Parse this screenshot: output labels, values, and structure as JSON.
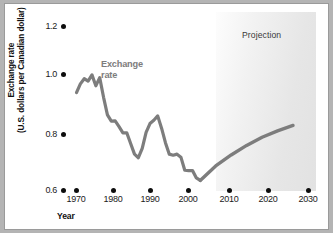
{
  "chart_data": {
    "type": "line",
    "title": "",
    "xlabel": "Year",
    "ylabel": "Exchange rate (U.S. dollars per Canadian dollar)",
    "ylabel_line1": "Exchange rate",
    "ylabel_line2": "(U.S. dollars per Canadian dollar)",
    "xlim": [
      1967,
      2031
    ],
    "ylim": [
      0.6,
      1.2
    ],
    "grid": false,
    "legend": "none",
    "xticks": [
      "1970",
      "1980",
      "1990",
      "2000",
      "2010",
      "2020",
      "2030"
    ],
    "xtick_values": [
      1970,
      1980,
      1990,
      2000,
      2010,
      2020,
      2030
    ],
    "yticks": [
      "0.6",
      "0.8",
      "1.0",
      "1.2"
    ],
    "ytick_values": [
      0.6,
      0.8,
      1.0,
      1.2
    ],
    "annotations": [
      {
        "name": "series-label",
        "text": "Exchange\nrate",
        "line1": "Exchange",
        "line2": "rate",
        "color": "#7d7d7d"
      },
      {
        "name": "projection-label",
        "text": "Projection",
        "color": "#3a3a3a"
      }
    ],
    "shaded_region": {
      "label": "Projection",
      "x_start": 2003,
      "x_end": 2031,
      "color": "#e6e6e6"
    },
    "series": [
      {
        "name": "Exchange rate",
        "color": "#7d7d7d",
        "kind": "historical",
        "x": [
          1970,
          1971,
          1972,
          1973,
          1974,
          1975,
          1976,
          1977,
          1978,
          1979,
          1980,
          1981,
          1982,
          1983,
          1984,
          1985,
          1986,
          1987,
          1988,
          1989,
          1990,
          1991,
          1992,
          1993,
          1994,
          1995,
          1996,
          1997,
          1998,
          1999,
          2000,
          2001,
          2002
        ],
        "y": [
          0.958,
          0.99,
          1.009,
          1.0,
          1.023,
          0.983,
          1.013,
          0.941,
          0.877,
          0.854,
          0.855,
          0.834,
          0.811,
          0.811,
          0.772,
          0.733,
          0.72,
          0.754,
          0.813,
          0.845,
          0.857,
          0.873,
          0.828,
          0.775,
          0.733,
          0.729,
          0.733,
          0.722,
          0.674,
          0.673,
          0.673,
          0.646,
          0.637
        ]
      },
      {
        "name": "Exchange rate projection",
        "color": "#7d7d7d",
        "kind": "projection",
        "x": [
          2002,
          2006,
          2010,
          2014,
          2018,
          2022,
          2026
        ],
        "y": [
          0.637,
          0.69,
          0.73,
          0.765,
          0.795,
          0.818,
          0.838
        ]
      }
    ]
  },
  "axis": {
    "y_title_line1": "Exchange rate",
    "y_title_line2": "(U.S. dollars per Canadian dollar)",
    "x_title": "Year"
  }
}
